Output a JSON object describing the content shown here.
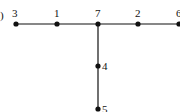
{
  "figure": {
    "panel_label": "l)",
    "edge_color": "#111111",
    "node_color": "#111111"
  },
  "graph": {
    "type": "tree",
    "nodes": [
      {
        "id": "3",
        "label": "3",
        "x": 16,
        "y": 24
      },
      {
        "id": "1",
        "label": "1",
        "x": 57,
        "y": 24
      },
      {
        "id": "7",
        "label": "7",
        "x": 98,
        "y": 24
      },
      {
        "id": "2",
        "label": "2",
        "x": 138,
        "y": 24
      },
      {
        "id": "6",
        "label": "6",
        "x": 179,
        "y": 24
      },
      {
        "id": "4",
        "label": "4",
        "x": 98,
        "y": 66
      },
      {
        "id": "5",
        "label": "5",
        "x": 98,
        "y": 109
      }
    ],
    "edges": [
      [
        "3",
        "1"
      ],
      [
        "1",
        "7"
      ],
      [
        "7",
        "2"
      ],
      [
        "2",
        "6"
      ],
      [
        "7",
        "4"
      ],
      [
        "4",
        "5"
      ]
    ]
  }
}
